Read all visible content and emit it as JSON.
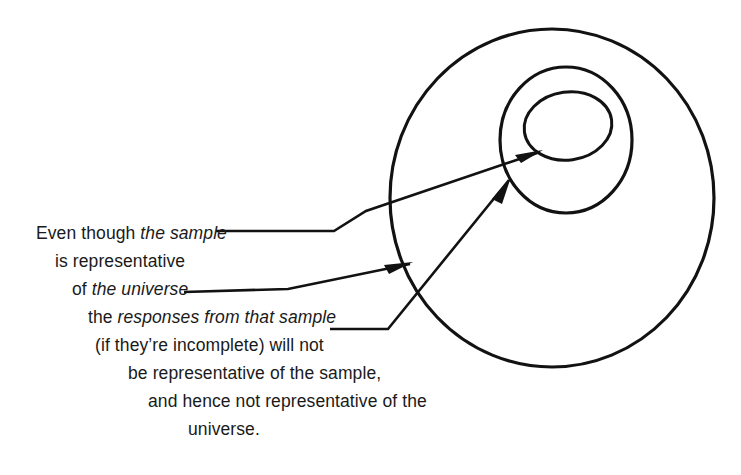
{
  "figure": {
    "kind": "venn-style-nested-circles-diagram",
    "background_color": "#ffffff",
    "ink_color": "#121212"
  },
  "shapes": {
    "outer_circle": {
      "name": "universe-circle",
      "cx": 552,
      "cy": 198,
      "rx": 162,
      "ry": 169
    },
    "middle_circle": {
      "name": "sample-circle",
      "cx": 566,
      "cy": 140,
      "rx": 66,
      "ry": 73
    },
    "inner_circle": {
      "name": "responses-circle",
      "cx": 568,
      "cy": 126,
      "rx": 44,
      "ry": 34
    }
  },
  "caption": {
    "lines": [
      {
        "id": "line-1",
        "x": 36,
        "y": 236,
        "plain_before": "Even though ",
        "italic": "the sample",
        "plain_after": ""
      },
      {
        "id": "line-2",
        "x": 55,
        "y": 264,
        "plain_before": "is representative",
        "italic": "",
        "plain_after": ""
      },
      {
        "id": "line-3",
        "x": 72,
        "y": 292,
        "plain_before": "of ",
        "italic": "the universe",
        "plain_after": ""
      },
      {
        "id": "line-4",
        "x": 88,
        "y": 320,
        "plain_before": "the ",
        "italic": "responses from that sample",
        "plain_after": ""
      },
      {
        "id": "line-5",
        "x": 95,
        "y": 348,
        "plain_before": "(if they’re incomplete) will not",
        "italic": "",
        "plain_after": ""
      },
      {
        "id": "line-6",
        "x": 128,
        "y": 376,
        "plain_before": "be representative of the sample,",
        "italic": "",
        "plain_after": ""
      },
      {
        "id": "line-7",
        "x": 148,
        "y": 404,
        "plain_before": "and hence not representative of the",
        "italic": "",
        "plain_after": ""
      },
      {
        "id": "line-8",
        "x": 188,
        "y": 432,
        "plain_before": "universe.",
        "italic": "",
        "plain_after": ""
      }
    ],
    "full_text": "Even though the sample is representative of the universe the responses from that sample (if they’re incomplete) will not be representative of the sample, and hence not representative of the universe."
  },
  "connectors": [
    {
      "id": "leader-the-sample",
      "name": "leader-the-sample-to-inner-circle",
      "from_label": "the sample",
      "target": "responses-circle",
      "path": "M 216 231 L 334 231 L 366 211"
    },
    {
      "id": "leader-the-universe",
      "name": "arrow-the-universe-to-outer-circle",
      "from_label": "the universe",
      "target": "universe-circle",
      "path": "M 184 292 L 288 289 L 410 264",
      "arrow_at": {
        "x": 410,
        "y": 264,
        "angle_deg": -11.6
      }
    },
    {
      "id": "leader-that-sample",
      "name": "arrow-that-sample-to-middle-circle",
      "from_label": "responses from that sample",
      "target": "sample-circle",
      "path": "M 330 329 L 388 329 L 509 180",
      "arrow_at": {
        "x": 509,
        "y": 180,
        "angle_deg": -50.9
      }
    },
    {
      "id": "leader-sample-continuation",
      "name": "arrow-the-sample-continuation-to-inner-circle",
      "from_label": "the sample",
      "target": "responses-circle",
      "path": "M 366 211 L 540 152",
      "arrow_at": {
        "x": 540,
        "y": 152,
        "angle_deg": -18.7
      }
    }
  ]
}
